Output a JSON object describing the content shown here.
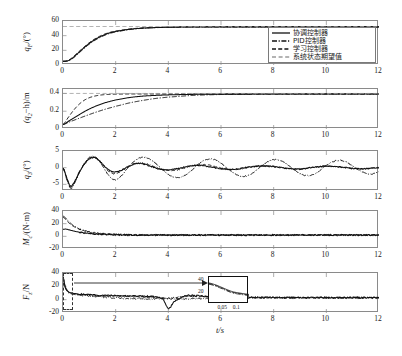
{
  "figure": {
    "xlabel": "t/s",
    "x_range": [
      0,
      12
    ],
    "x_ticks": [
      0,
      2,
      4,
      6,
      8,
      10,
      12
    ],
    "legend_position": "upper-right of subplot 1"
  },
  "legend": {
    "entries": [
      {
        "label": "协调控制器",
        "style": "solid",
        "color": "#111111"
      },
      {
        "label": "PID控制器",
        "style": "dashdot",
        "color": "#111111"
      },
      {
        "label": "学习控制器",
        "style": "dashed",
        "color": "#111111"
      },
      {
        "label": "系统状态期望值",
        "style": "dashed-light",
        "color": "#9a9a9a"
      }
    ]
  },
  "inset": {
    "y_ticks": [
      40,
      20
    ],
    "x_ticks": [
      0.05,
      0.1
    ],
    "source_label": "origin-detail"
  },
  "chart_data": [
    {
      "type": "line",
      "title": "",
      "xlabel": "",
      "ylabel": "q_F/(°)",
      "ylabel_parts": {
        "base": "q",
        "sub": "F",
        "unit": "/(°)"
      },
      "xlim": [
        0,
        12
      ],
      "ylim": [
        0,
        60
      ],
      "yticks": [
        0,
        20,
        40,
        60
      ],
      "xticks": [
        0,
        2,
        4,
        6,
        8,
        10,
        12
      ],
      "grid": false,
      "setpoint": 52,
      "series": [
        {
          "name": "协调控制器",
          "style": "solid",
          "x": [
            0,
            0.15,
            0.3,
            0.5,
            0.75,
            1.0,
            1.25,
            1.5,
            1.75,
            2.0,
            2.5,
            3.0,
            3.5,
            4.0,
            5.0,
            6.0,
            7.0,
            8.0,
            9.0,
            10.0,
            11.0,
            12.0
          ],
          "values": [
            5,
            5.5,
            8,
            14,
            22,
            29.5,
            35.5,
            40,
            43.5,
            45.8,
            48.6,
            50.2,
            51.0,
            51.5,
            51.9,
            52.0,
            52.0,
            52.0,
            52.0,
            52.0,
            52.0,
            52.0
          ]
        },
        {
          "name": "PID控制器",
          "style": "dashdot",
          "x": [
            0,
            0.15,
            0.3,
            0.5,
            0.75,
            1.0,
            1.25,
            1.5,
            1.75,
            2.0,
            2.5,
            3.0,
            3.5,
            4.0,
            5.0,
            6.0,
            7.0,
            8.0,
            9.0,
            10.0,
            11.0,
            12.0
          ],
          "values": [
            5,
            5.3,
            7.4,
            13,
            21,
            28.5,
            34.5,
            39.2,
            42.8,
            45.2,
            48.2,
            50.0,
            50.9,
            51.4,
            51.9,
            52.0,
            52.0,
            52.0,
            52.0,
            52.0,
            52.0,
            52.0
          ]
        },
        {
          "name": "学习控制器",
          "style": "dashed",
          "x": [
            0,
            0.15,
            0.3,
            0.5,
            0.75,
            1.0,
            1.25,
            1.5,
            1.75,
            2.0,
            2.5,
            3.0,
            3.5,
            4.0,
            5.0,
            6.0,
            7.0,
            8.0,
            9.0,
            10.0,
            11.0,
            12.0
          ],
          "values": [
            5,
            5.8,
            8.6,
            15,
            23,
            30.5,
            36.5,
            41,
            44.2,
            46.4,
            49.0,
            50.5,
            51.2,
            51.6,
            52.0,
            52.1,
            52.1,
            52.1,
            52.1,
            52.1,
            52.1,
            52.1
          ]
        },
        {
          "name": "系统状态期望值",
          "style": "dashed-light",
          "x": [
            0,
            12
          ],
          "values": [
            52.5,
            52.5
          ]
        }
      ]
    },
    {
      "type": "line",
      "title": "",
      "xlabel": "",
      "ylabel": "(q_2-h)/m",
      "ylabel_parts": {
        "base": "(q",
        "sub": "2",
        "unit": "−h)/m"
      },
      "xlim": [
        0,
        12
      ],
      "ylim": [
        0,
        0.45
      ],
      "yticks": [
        0,
        0.2,
        0.4
      ],
      "xticks": [
        0,
        2,
        4,
        6,
        8,
        10,
        12
      ],
      "grid": false,
      "setpoint": 0.4,
      "series": [
        {
          "name": "协调控制器",
          "style": "solid",
          "x": [
            0,
            0.25,
            0.5,
            0.75,
            1.0,
            1.25,
            1.5,
            1.75,
            2.0,
            2.5,
            3.0,
            3.5,
            4.0,
            5.0,
            6.0,
            8.0,
            10.0,
            12.0
          ],
          "values": [
            0.05,
            0.095,
            0.14,
            0.185,
            0.225,
            0.258,
            0.286,
            0.308,
            0.327,
            0.353,
            0.369,
            0.378,
            0.384,
            0.39,
            0.392,
            0.393,
            0.393,
            0.393
          ]
        },
        {
          "name": "PID控制器",
          "style": "dashdot",
          "x": [
            0,
            0.25,
            0.5,
            0.75,
            1.0,
            1.25,
            1.5,
            1.75,
            2.0,
            2.5,
            3.0,
            3.5,
            4.0,
            5.0,
            6.0,
            8.0,
            10.0,
            12.0
          ],
          "values": [
            0.05,
            0.08,
            0.108,
            0.136,
            0.163,
            0.189,
            0.213,
            0.235,
            0.256,
            0.292,
            0.32,
            0.343,
            0.359,
            0.379,
            0.388,
            0.392,
            0.393,
            0.393
          ]
        },
        {
          "name": "学习控制器",
          "style": "dashed",
          "x": [
            0,
            0.2,
            0.4,
            0.6,
            0.8,
            1.0,
            1.2,
            1.4,
            1.6,
            1.8,
            2.0,
            2.5,
            3.0,
            4.0,
            5.0,
            6.0,
            8.0,
            10.0,
            12.0
          ],
          "values": [
            0.05,
            0.13,
            0.21,
            0.275,
            0.322,
            0.352,
            0.37,
            0.381,
            0.387,
            0.39,
            0.392,
            0.394,
            0.394,
            0.394,
            0.394,
            0.394,
            0.394,
            0.394,
            0.394
          ]
        },
        {
          "name": "系统状态期望值",
          "style": "dashed-light",
          "x": [
            0,
            12
          ],
          "values": [
            0.4,
            0.4
          ]
        }
      ]
    },
    {
      "type": "line",
      "title": "",
      "xlabel": "",
      "ylabel": "q_3/(°)",
      "ylabel_parts": {
        "base": "q",
        "sub": "3",
        "unit": "/(°)"
      },
      "xlim": [
        0,
        12
      ],
      "ylim": [
        -7,
        5
      ],
      "yticks": [
        -5,
        0,
        5
      ],
      "xticks": [
        0,
        2,
        4,
        6,
        8,
        10,
        12
      ],
      "grid": false,
      "description": "damped oscillation; dashdot PID keeps larger sustained oscillation than solid coordinated controller",
      "series": [
        {
          "name": "协调控制器",
          "style": "solid",
          "x": [
            0,
            0.15,
            0.3,
            0.45,
            0.6,
            0.8,
            1.0,
            1.2,
            1.4,
            1.6,
            1.8,
            2.0,
            2.2,
            2.5,
            2.8,
            3.1,
            3.4,
            3.7,
            4.0,
            4.4,
            4.8,
            5.2,
            5.6,
            6.0,
            6.5,
            7.0,
            7.5,
            8.0,
            8.5,
            9.0,
            9.5,
            10.0,
            10.5,
            11.0,
            11.5,
            12.0
          ],
          "values": [
            0,
            -3.2,
            -5.5,
            -4.0,
            -1.6,
            0.9,
            2.6,
            3.0,
            1.9,
            0.2,
            -1.0,
            -1.3,
            -0.8,
            0.4,
            1.3,
            1.0,
            0.2,
            -0.5,
            -0.7,
            -0.2,
            0.5,
            0.7,
            0.2,
            -0.3,
            -0.5,
            0.1,
            0.5,
            0.3,
            -0.2,
            -0.4,
            0.1,
            0.4,
            0.2,
            -0.2,
            -0.3,
            0.0
          ]
        },
        {
          "name": "PID控制器",
          "style": "dashdot",
          "x": [
            0,
            0.15,
            0.3,
            0.45,
            0.6,
            0.8,
            1.0,
            1.2,
            1.4,
            1.6,
            1.8,
            2.0,
            2.2,
            2.4,
            2.7,
            3.0,
            3.3,
            3.6,
            3.9,
            4.2,
            4.5,
            4.8,
            5.1,
            5.4,
            5.7,
            6.0,
            6.3,
            6.6,
            6.9,
            7.2,
            7.5,
            7.8,
            8.1,
            8.4,
            8.7,
            9.0,
            9.3,
            9.6,
            9.9,
            10.2,
            10.5,
            10.8,
            11.1,
            11.4,
            11.7,
            12.0
          ],
          "values": [
            0,
            -3.6,
            -6.2,
            -4.5,
            -1.8,
            1.1,
            3.0,
            3.3,
            1.8,
            -0.8,
            -2.9,
            -3.6,
            -2.6,
            -0.6,
            1.9,
            3.1,
            2.6,
            0.7,
            -1.5,
            -2.8,
            -2.8,
            -1.4,
            0.8,
            2.3,
            2.5,
            1.4,
            -0.6,
            -2.2,
            -2.6,
            -1.7,
            0.3,
            1.9,
            2.4,
            1.6,
            -0.2,
            -1.8,
            -2.4,
            -1.7,
            0.1,
            1.6,
            2.2,
            1.5,
            -0.1,
            -1.4,
            -2.0,
            -1.2
          ]
        },
        {
          "name": "学习控制器",
          "style": "dashed",
          "x": [
            0,
            0.15,
            0.3,
            0.45,
            0.6,
            0.8,
            1.0,
            1.2,
            1.4,
            1.6,
            1.8,
            2.0,
            2.3,
            2.6,
            3.0,
            3.4,
            3.8,
            4.2,
            4.6,
            5.0,
            5.5,
            6.0,
            6.5,
            7.0,
            7.5,
            8.0,
            8.5,
            9.0,
            9.5,
            10.0,
            10.5,
            11.0,
            11.5,
            12.0
          ],
          "values": [
            0,
            -3.4,
            -5.8,
            -4.2,
            -1.7,
            1.0,
            2.8,
            3.1,
            1.9,
            0.0,
            -1.4,
            -1.8,
            -0.6,
            0.9,
            1.4,
            0.5,
            -0.6,
            -0.9,
            -0.1,
            0.7,
            0.8,
            -0.1,
            -0.6,
            0.0,
            0.6,
            0.4,
            -0.2,
            -0.5,
            0.1,
            0.5,
            0.2,
            -0.3,
            -0.3,
            0.1
          ]
        }
      ]
    },
    {
      "type": "line",
      "title": "",
      "xlabel": "",
      "ylabel": "M_c/(N·m)",
      "ylabel_parts": {
        "base": "M",
        "sub": "c",
        "unit": "/(N·m)"
      },
      "xlim": [
        0,
        12
      ],
      "ylim": [
        -20,
        40
      ],
      "yticks": [
        -20,
        0,
        20,
        40
      ],
      "xticks": [
        0,
        2,
        4,
        6,
        8,
        10,
        12
      ],
      "grid": false,
      "description": "initial torque spike near 32 decaying to small noisy band around 2",
      "series": [
        {
          "name": "协调控制器",
          "style": "solid",
          "x": [
            0,
            0.1,
            0.2,
            0.35,
            0.5,
            0.7,
            0.9,
            1.1,
            1.4,
            1.8,
            2.2,
            2.6,
            3.0,
            3.6,
            4.2,
            5.0,
            6.0,
            7.0,
            8.0,
            9.0,
            10.0,
            11.0,
            12.0
          ],
          "values": [
            11,
            11.5,
            10.5,
            9,
            7.5,
            6,
            4.8,
            4.0,
            3.2,
            2.6,
            2.3,
            2.1,
            2.0,
            2.0,
            2.0,
            2.0,
            2.0,
            2.0,
            2.0,
            2.0,
            2.0,
            2.0,
            2.0
          ]
        },
        {
          "name": "PID控制器",
          "style": "dashdot",
          "x": [
            0,
            0.1,
            0.2,
            0.35,
            0.5,
            0.7,
            0.9,
            1.1,
            1.4,
            1.8,
            2.2,
            2.6,
            3.0,
            3.6,
            4.2,
            5.0,
            6.0,
            7.0,
            8.0,
            9.0,
            10.0,
            11.0,
            12.0
          ],
          "values": [
            32,
            29,
            24,
            18.5,
            14.5,
            10.5,
            8.0,
            6.2,
            4.6,
            3.4,
            2.8,
            2.4,
            2.2,
            2.1,
            2.0,
            2.0,
            2.0,
            2.0,
            2.0,
            2.0,
            2.0,
            2.0,
            2.0
          ]
        },
        {
          "name": "学习控制器",
          "style": "dashed",
          "x": [
            0,
            0.1,
            0.2,
            0.35,
            0.5,
            0.7,
            0.9,
            1.1,
            1.4,
            1.8,
            2.2,
            2.6,
            3.0,
            3.6,
            4.2,
            5.0,
            6.0,
            7.0,
            8.0,
            9.0,
            10.0,
            11.0,
            12.0
          ],
          "values": [
            30,
            27,
            22,
            17,
            13.5,
            10,
            7.6,
            6.0,
            4.5,
            3.3,
            2.7,
            2.4,
            2.2,
            2.1,
            2.0,
            2.0,
            2.0,
            2.0,
            2.0,
            2.0,
            2.0,
            2.0,
            2.0
          ]
        }
      ]
    },
    {
      "type": "line",
      "title": "",
      "xlabel": "t/s",
      "ylabel": "F_z/N",
      "ylabel_parts": {
        "base": "F",
        "sub": "z",
        "unit": "/N"
      },
      "xlim": [
        0,
        12
      ],
      "ylim": [
        -20,
        40
      ],
      "yticks": [
        -20,
        0,
        20,
        40
      ],
      "xticks": [
        0,
        2,
        4,
        6,
        8,
        10,
        12
      ],
      "grid": false,
      "description": "initial force spike ~35 at t=0, noisy decay to ~3; PID trace dips to -13 near t=4",
      "series": [
        {
          "name": "协调控制器",
          "style": "solid",
          "x": [
            0,
            0.08,
            0.2,
            0.4,
            0.7,
            1.0,
            1.5,
            2.0,
            2.5,
            3.0,
            3.5,
            3.8,
            4.0,
            4.2,
            4.6,
            5.0,
            5.5,
            6.0,
            7.0,
            8.0,
            9.0,
            10.0,
            11.0,
            12.0
          ],
          "values": [
            35,
            20,
            12,
            9.5,
            8.0,
            7.2,
            6.4,
            6.0,
            5.6,
            5.2,
            4.4,
            1.0,
            -13.0,
            -4.0,
            5.2,
            6.0,
            5.0,
            4.0,
            3.4,
            3.2,
            3.0,
            3.0,
            3.0,
            3.0
          ]
        },
        {
          "name": "PID控制器",
          "style": "dashdot",
          "x": [
            0,
            0.08,
            0.2,
            0.4,
            0.7,
            1.0,
            1.5,
            2.0,
            2.5,
            3.0,
            3.5,
            4.0,
            4.5,
            5.0,
            5.5,
            6.0,
            7.0,
            8.0,
            9.0,
            10.0,
            11.0,
            12.0
          ],
          "values": [
            33,
            18,
            10.5,
            8.0,
            6.5,
            5.5,
            4.0,
            2.6,
            1.8,
            1.4,
            1.2,
            1.1,
            1.2,
            1.4,
            1.8,
            2.4,
            2.8,
            2.9,
            3.0,
            3.0,
            3.0,
            3.0
          ]
        },
        {
          "name": "学习控制器",
          "style": "dashed",
          "x": [
            0,
            0.08,
            0.2,
            0.4,
            0.7,
            1.0,
            1.5,
            2.0,
            2.5,
            3.0,
            3.5,
            4.0,
            4.5,
            5.0,
            5.5,
            6.0,
            7.0,
            8.0,
            9.0,
            10.0,
            11.0,
            12.0
          ],
          "values": [
            34,
            19,
            11.5,
            9.0,
            7.5,
            6.6,
            5.6,
            5.0,
            4.6,
            4.2,
            3.8,
            2.0,
            4.2,
            5.0,
            4.4,
            3.6,
            3.2,
            3.0,
            3.0,
            3.0,
            3.0,
            3.0
          ]
        }
      ]
    }
  ]
}
